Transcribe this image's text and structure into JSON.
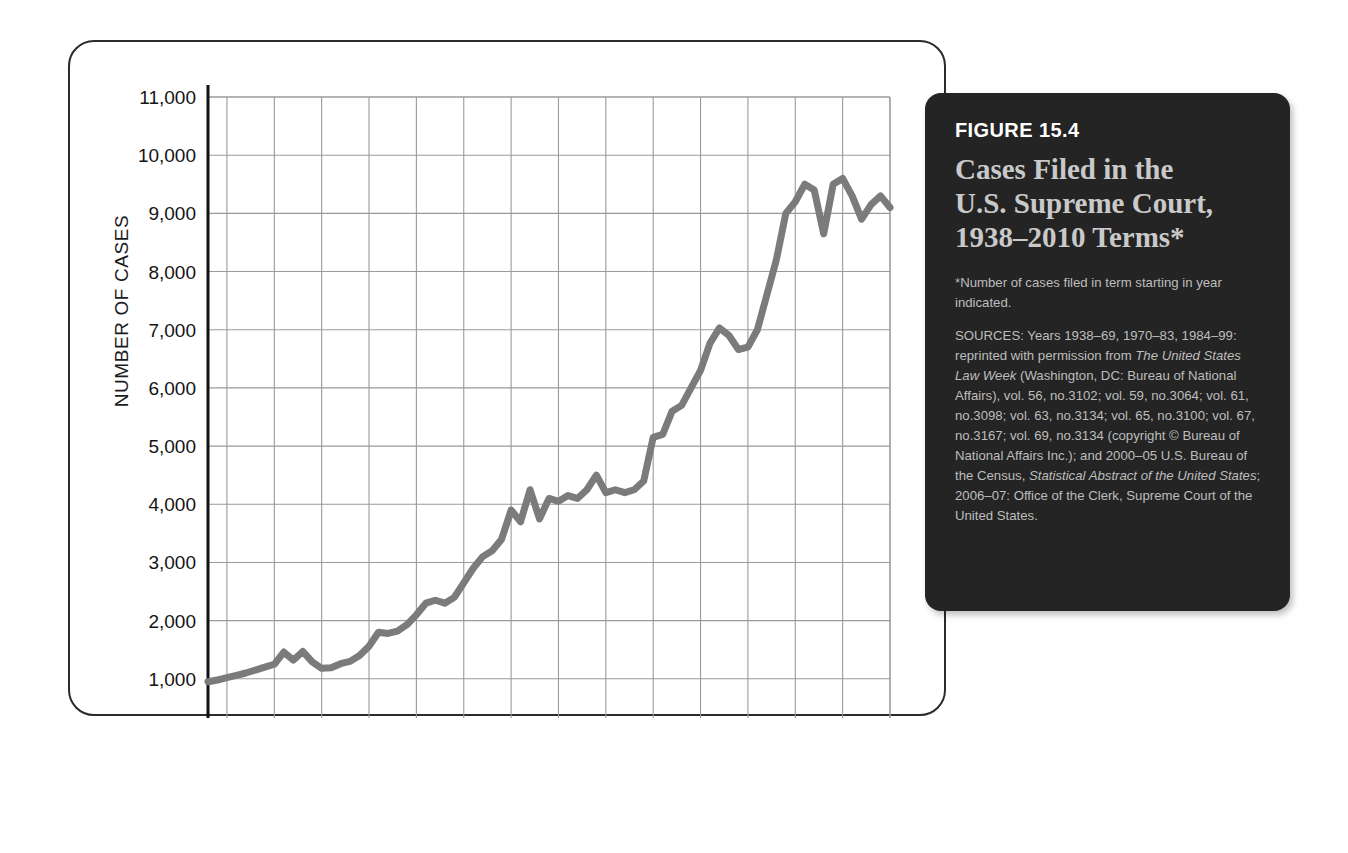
{
  "figure": {
    "number": "FIGURE 15.4",
    "title_line1": "Cases Filed in the",
    "title_line2": "U.S. Supreme Court,",
    "title_line3": "1938–2010 Terms*",
    "note": "*Number of cases filed in term starting in year indicated.",
    "sources_lead": "SOURCES: Years 1938–69, 1970–83, 1984–99: reprinted with permission from ",
    "sources_italic1": "The United States Law Week",
    "sources_mid1": " (Washington, DC: Bureau of National Affairs), vol. 56, no.3102; vol. 59, no.3064; vol. 61, no.3098; vol. 63, no.3134; vol. 65, no.3100; vol. 67, no.3167; vol. 69, no.3134 (copyright © Bureau of National Affairs Inc.); and 2000–05 U.S. Bureau of the Census, ",
    "sources_italic2": "Statistical Abstract of the United States",
    "sources_tail": "; 2006–07: Office of the Clerk, Supreme Court of the United States."
  },
  "colors": {
    "line": "#7b7b7b",
    "grid": "#9a9a9a",
    "axis": "#111111",
    "panel_bg": "#242424",
    "panel_title": "#c9c9c9",
    "card_border": "#2b2b2b"
  },
  "chart_data": {
    "type": "line",
    "title": "Cases Filed in the U.S. Supreme Court, 1938–2010 Terms",
    "xlabel": "",
    "ylabel": "NUMBER OF CASES",
    "xlim": [
      1938,
      2010
    ],
    "ylim": [
      0,
      11000
    ],
    "grid": true,
    "legend": "none",
    "yticks": [
      0,
      1000,
      2000,
      3000,
      4000,
      5000,
      6000,
      7000,
      8000,
      9000,
      10000,
      11000
    ],
    "ytick_labels": [
      "0",
      "1,000",
      "2,000",
      "3,000",
      "4,000",
      "5,000",
      "6,000",
      "7,000",
      "8,000",
      "9,000",
      "10,000",
      "11,000"
    ],
    "xticks": [
      1940,
      1945,
      1950,
      1955,
      1960,
      1965,
      1970,
      1975,
      1980,
      1985,
      1990,
      1995,
      2000,
      2005,
      2010
    ],
    "xtick_labels": [
      "1940",
      "1945",
      "1950",
      "1955",
      "1960",
      "1965",
      "1970",
      "1975",
      "1980",
      "1985",
      "1990",
      "1995",
      "2000",
      "2005",
      "2010"
    ],
    "series_name": "Cases filed",
    "x": [
      1938,
      1939,
      1940,
      1941,
      1942,
      1943,
      1944,
      1945,
      1946,
      1947,
      1948,
      1949,
      1950,
      1951,
      1952,
      1953,
      1954,
      1955,
      1956,
      1957,
      1958,
      1959,
      1960,
      1961,
      1962,
      1963,
      1964,
      1965,
      1966,
      1967,
      1968,
      1969,
      1970,
      1971,
      1972,
      1973,
      1974,
      1975,
      1976,
      1977,
      1978,
      1979,
      1980,
      1981,
      1982,
      1983,
      1984,
      1985,
      1986,
      1987,
      1988,
      1989,
      1990,
      1991,
      1992,
      1993,
      1994,
      1995,
      1996,
      1997,
      1998,
      1999,
      2000,
      2001,
      2002,
      2003,
      2004,
      2005,
      2006,
      2007,
      2008,
      2009,
      2010
    ],
    "values": [
      950,
      980,
      1020,
      1060,
      1100,
      1150,
      1200,
      1250,
      1460,
      1320,
      1470,
      1290,
      1180,
      1190,
      1260,
      1300,
      1400,
      1560,
      1800,
      1780,
      1820,
      1930,
      2100,
      2300,
      2350,
      2300,
      2400,
      2650,
      2900,
      3100,
      3200,
      3400,
      3900,
      3700,
      4250,
      3750,
      4100,
      4050,
      4150,
      4100,
      4250,
      4500,
      4200,
      4250,
      4200,
      4250,
      4400,
      5150,
      5200,
      5600,
      5700,
      6000,
      6300,
      6770,
      7030,
      6900,
      6660,
      6700,
      7000,
      7600,
      8200,
      9000,
      9200,
      9500,
      9400,
      8650,
      9500,
      9600,
      9300,
      8900,
      9150,
      9300,
      9100
    ]
  }
}
